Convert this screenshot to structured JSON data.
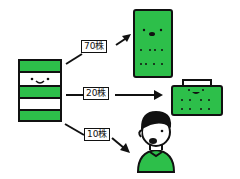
{
  "colors": {
    "green": "#2dbf4a",
    "outline": "#111111",
    "background": "#ffffff"
  },
  "source": {
    "name": "stock-stack",
    "layers": [
      "green",
      "white-face",
      "green",
      "white",
      "green"
    ]
  },
  "allocations": [
    {
      "label": "70株",
      "target": "tall-green-box"
    },
    {
      "label": "20株",
      "target": "green-case-box"
    },
    {
      "label": "10株",
      "target": "person"
    }
  ]
}
